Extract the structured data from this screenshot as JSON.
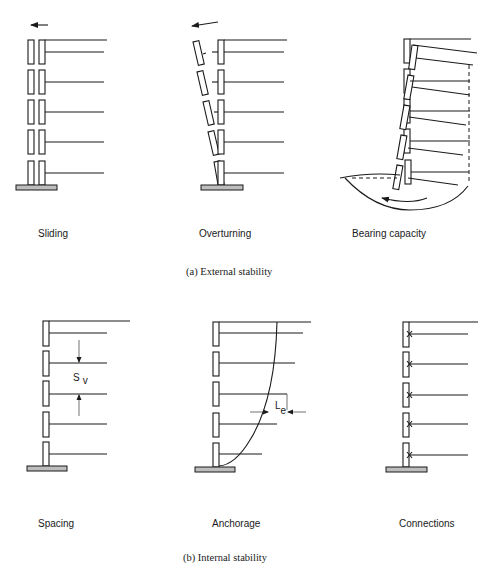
{
  "figure": {
    "external": {
      "caption": "(a) External stability",
      "panels": [
        {
          "label": "Sliding"
        },
        {
          "label": "Overturning"
        },
        {
          "label": "Bearing capacity"
        }
      ]
    },
    "internal": {
      "caption": "(b) Internal stability",
      "panels": [
        {
          "label": "Spacing",
          "symbol_main": "S",
          "symbol_sub": "v"
        },
        {
          "label": "Anchorage",
          "symbol_main": "L",
          "symbol_sub": "e"
        },
        {
          "label": "Connections"
        }
      ]
    },
    "colors": {
      "line": "#1a1a1a",
      "base_fill": "#bdbdbd",
      "background": "#ffffff"
    }
  }
}
